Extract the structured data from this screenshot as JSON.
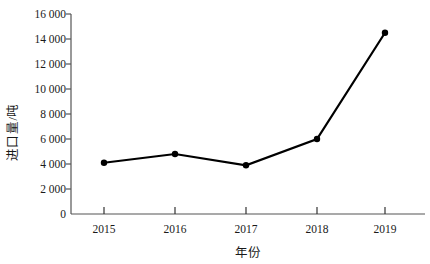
{
  "chart_data": {
    "type": "line",
    "title": "",
    "xlabel": "年份",
    "ylabel": "进口量/吨",
    "categories": [
      "2015",
      "2016",
      "2017",
      "2018",
      "2019"
    ],
    "values": [
      4100,
      4800,
      3900,
      6000,
      14500
    ],
    "series": [
      {
        "name": "进口量",
        "values": [
          4100,
          4800,
          3900,
          6000,
          14500
        ]
      }
    ],
    "ylim": [
      0,
      16000
    ],
    "yticks": [
      0,
      2000,
      4000,
      6000,
      8000,
      10000,
      12000,
      14000,
      16000
    ],
    "ytick_labels": [
      "0",
      "2 000",
      "4 000",
      "6 000",
      "8 000",
      "10 000",
      "12 000",
      "14 000",
      "16 000"
    ],
    "xtick_labels": [
      "2015",
      "2016",
      "2017",
      "2018",
      "2019"
    ],
    "grid": false,
    "legend": null,
    "legend_position": "none",
    "marker": "circle",
    "line_color": "#000000",
    "marker_color": "#000000",
    "axis_color": "#555555"
  }
}
